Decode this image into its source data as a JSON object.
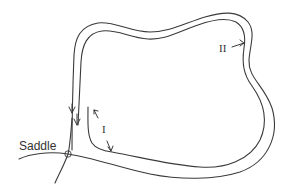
{
  "diagram": {
    "labels": {
      "saddle": "Saddle",
      "region_one": "I",
      "region_two": "II"
    },
    "elements": [
      {
        "name": "outer-trajectory",
        "description": "outer homoclinic-like loop leaving saddle to the right and returning from above"
      },
      {
        "name": "inner-trajectory",
        "description": "inner loop parallel to outer, ending near the saddle"
      },
      {
        "name": "stable-manifold",
        "description": "curve through the saddle point going down-left"
      },
      {
        "name": "saddle-point",
        "description": "small circle at intersection"
      },
      {
        "name": "flow-arrows",
        "description": "two downward arrows on left vertical branches"
      },
      {
        "name": "region-I-arrows",
        "description": "double arrow indicating gap I between curves near saddle"
      },
      {
        "name": "region-II-arrow",
        "description": "arrow pointing to the band on the right side"
      }
    ],
    "colors": {
      "stroke": "#3a3a3a",
      "text": "#333333",
      "background": "#ffffff"
    }
  }
}
